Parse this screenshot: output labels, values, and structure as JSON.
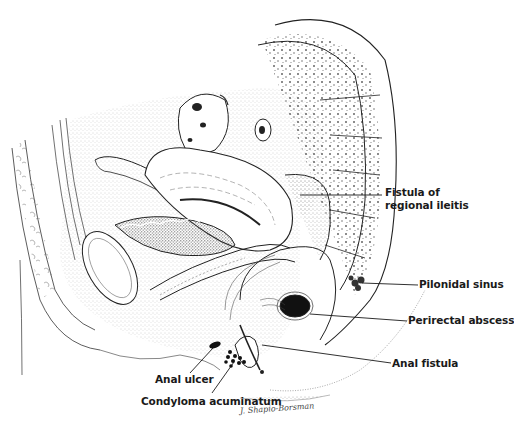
{
  "figure": {
    "labels": {
      "fistula_regional_ileitis_line1": "Fistula of",
      "fistula_regional_ileitis_line2": "regional ileitis",
      "pilonidal_sinus": "Pilonidal sinus",
      "perirectal_abscess": "Perirectal abscess",
      "anal_fistula": "Anal fistula",
      "anal_ulcer": "Anal ulcer",
      "condyloma_acuminatum": "Condyloma acuminatum"
    },
    "signature": "J. Shapio-Borsman",
    "colors": {
      "ink": "#1a1a1a",
      "stipple": "#555555",
      "background": "#ffffff"
    }
  }
}
